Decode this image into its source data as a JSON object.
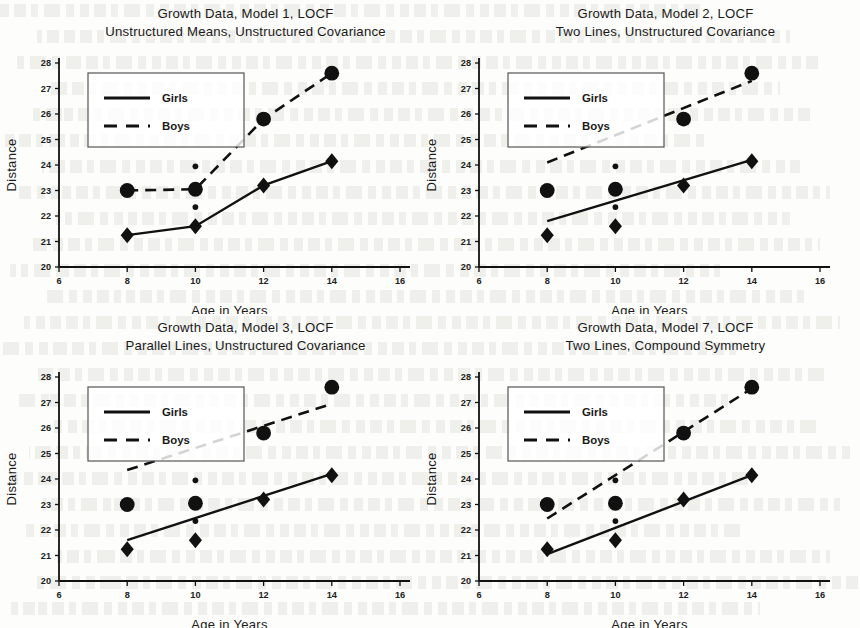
{
  "figure": {
    "panel_count": 4,
    "x_axis_label": "Age in Years",
    "y_axis_label": "Distance",
    "legend": {
      "girls_label": "Girls",
      "boys_label": "Boys"
    },
    "ink_color": "#111111",
    "background_color": "#fdfdfb"
  },
  "chart_data": [
    {
      "type": "line",
      "title": "Growth Data, Model 1, LOCF",
      "subtitle": "Unstructured Means, Unstructured Covariance",
      "title_line1": "Growth Data, Model 1, LOCF",
      "title_line2": "Unstructured Means, Unstructured Covariance",
      "xlabel": "Age in Years",
      "ylabel": "Distance",
      "xlim": [
        6,
        16
      ],
      "ylim": [
        20,
        28
      ],
      "xticks": [
        6,
        8,
        10,
        12,
        14,
        16
      ],
      "yticks": [
        20,
        21,
        22,
        23,
        24,
        25,
        26,
        27,
        28
      ],
      "grid": false,
      "legend_position": "upper-left",
      "x": [
        8,
        10,
        12,
        14
      ],
      "series": [
        {
          "name": "Girls",
          "style": "solid",
          "marker": "diamond",
          "values": [
            21.25,
            21.6,
            23.2,
            24.15
          ]
        },
        {
          "name": "Boys",
          "style": "dashed",
          "marker": "circle",
          "values": [
            23.0,
            23.05,
            25.8,
            27.6
          ]
        }
      ],
      "extra_points": [
        {
          "name": "small-dot-upper",
          "x": 10,
          "y": 23.95
        },
        {
          "name": "small-dot-lower",
          "x": 10,
          "y": 22.35
        }
      ],
      "fit_lines": [
        {
          "name": "Girls",
          "style": "solid",
          "points": [
            [
              8,
              21.25
            ],
            [
              10,
              21.6
            ],
            [
              12,
              23.2
            ],
            [
              14,
              24.15
            ]
          ]
        },
        {
          "name": "Boys",
          "style": "dashed",
          "points": [
            [
              8,
              23.0
            ],
            [
              10,
              23.05
            ],
            [
              12,
              25.8
            ],
            [
              14,
              27.6
            ]
          ]
        }
      ]
    },
    {
      "type": "scatter",
      "title": "Growth Data, Model 2, LOCF",
      "subtitle": "Two Lines, Unstructured Covariance",
      "title_line1": "Growth Data, Model 2, LOCF",
      "title_line2": "Two Lines, Unstructured Covariance",
      "xlabel": "Age in Years",
      "ylabel": "Distance",
      "xlim": [
        6,
        16
      ],
      "ylim": [
        20,
        28
      ],
      "xticks": [
        6,
        8,
        10,
        12,
        14,
        16
      ],
      "yticks": [
        20,
        21,
        22,
        23,
        24,
        25,
        26,
        27,
        28
      ],
      "grid": false,
      "legend_position": "upper-left",
      "x": [
        8,
        10,
        12,
        14
      ],
      "series": [
        {
          "name": "Girls",
          "style": "solid",
          "marker": "diamond",
          "values": [
            21.25,
            21.6,
            23.2,
            24.15
          ]
        },
        {
          "name": "Boys",
          "style": "dashed",
          "marker": "circle",
          "values": [
            23.0,
            23.05,
            25.8,
            27.6
          ]
        }
      ],
      "extra_points": [
        {
          "name": "small-dot-upper",
          "x": 10,
          "y": 23.95
        },
        {
          "name": "small-dot-lower",
          "x": 10,
          "y": 22.35
        }
      ],
      "fit_lines": [
        {
          "name": "Girls",
          "style": "solid",
          "points": [
            [
              8,
              21.8
            ],
            [
              14,
              24.2
            ]
          ]
        },
        {
          "name": "Boys",
          "style": "dashed",
          "points": [
            [
              8,
              24.1
            ],
            [
              14,
              27.3
            ]
          ]
        }
      ]
    },
    {
      "type": "scatter",
      "title": "Growth Data, Model 3, LOCF",
      "subtitle": "Parallel Lines, Unstructured Covariance",
      "title_line1": "Growth Data, Model 3, LOCF",
      "title_line2": "Parallel Lines, Unstructured Covariance",
      "xlabel": "Age in Years",
      "ylabel": "Distance",
      "xlim": [
        6,
        16
      ],
      "ylim": [
        20,
        28
      ],
      "xticks": [
        6,
        8,
        10,
        12,
        14,
        16
      ],
      "yticks": [
        20,
        21,
        22,
        23,
        24,
        25,
        26,
        27,
        28
      ],
      "grid": false,
      "legend_position": "upper-left",
      "x": [
        8,
        10,
        12,
        14
      ],
      "series": [
        {
          "name": "Girls",
          "style": "solid",
          "marker": "diamond",
          "values": [
            21.25,
            21.6,
            23.2,
            24.15
          ]
        },
        {
          "name": "Boys",
          "style": "dashed",
          "marker": "circle",
          "values": [
            23.0,
            23.05,
            25.8,
            27.6
          ]
        }
      ],
      "extra_points": [
        {
          "name": "small-dot-upper",
          "x": 10,
          "y": 23.95
        },
        {
          "name": "small-dot-lower",
          "x": 10,
          "y": 22.35
        }
      ],
      "fit_lines": [
        {
          "name": "Girls",
          "style": "solid",
          "points": [
            [
              8,
              21.6
            ],
            [
              14,
              24.2
            ]
          ]
        },
        {
          "name": "Boys",
          "style": "dashed",
          "points": [
            [
              8,
              24.35
            ],
            [
              14,
              26.95
            ]
          ]
        }
      ]
    },
    {
      "type": "scatter",
      "title": "Growth Data, Model 7, LOCF",
      "subtitle": "Two Lines, Compound Symmetry",
      "title_line1": "Growth Data, Model 7, LOCF",
      "title_line2": "Two Lines, Compound Symmetry",
      "xlabel": "Age in Years",
      "ylabel": "Distance",
      "xlim": [
        6,
        16
      ],
      "ylim": [
        20,
        28
      ],
      "xticks": [
        6,
        8,
        10,
        12,
        14,
        16
      ],
      "yticks": [
        20,
        21,
        22,
        23,
        24,
        25,
        26,
        27,
        28
      ],
      "grid": false,
      "legend_position": "upper-left",
      "x": [
        8,
        10,
        12,
        14
      ],
      "series": [
        {
          "name": "Girls",
          "style": "solid",
          "marker": "diamond",
          "values": [
            21.25,
            21.6,
            23.2,
            24.15
          ]
        },
        {
          "name": "Boys",
          "style": "dashed",
          "marker": "circle",
          "values": [
            23.0,
            23.05,
            25.8,
            27.6
          ]
        }
      ],
      "extra_points": [
        {
          "name": "small-dot-upper",
          "x": 10,
          "y": 23.95
        },
        {
          "name": "small-dot-lower",
          "x": 10,
          "y": 22.35
        }
      ],
      "fit_lines": [
        {
          "name": "Girls",
          "style": "solid",
          "points": [
            [
              8,
              21.05
            ],
            [
              14,
              24.15
            ]
          ]
        },
        {
          "name": "Boys",
          "style": "dashed",
          "points": [
            [
              8,
              22.45
            ],
            [
              14,
              27.55
            ]
          ]
        }
      ]
    }
  ]
}
